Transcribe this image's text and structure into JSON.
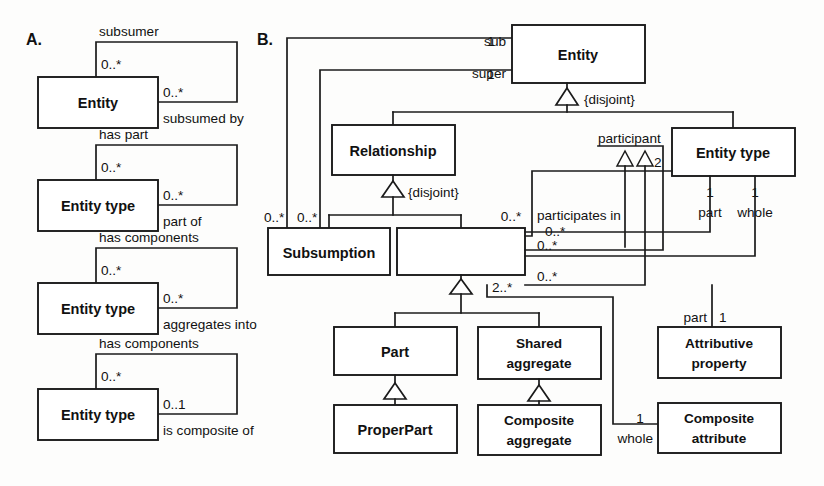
{
  "figure": {
    "panels": [
      {
        "id": "A",
        "letter": "A."
      },
      {
        "id": "B",
        "letter": "B."
      }
    ]
  },
  "panel_a": {
    "letter": "A.",
    "groups": [
      {
        "name": "subsumption-relation",
        "class_label": "Entity",
        "top_role": "subsumer",
        "top_multiplicity": "0..*",
        "bottom_role": "subsumed by",
        "bottom_multiplicity": "0..*"
      },
      {
        "name": "has-part-relation",
        "class_label": "Entity type",
        "top_role": "has part",
        "top_multiplicity": "0..*",
        "bottom_role": "part of",
        "bottom_multiplicity": "0..*"
      },
      {
        "name": "aggregation-relation",
        "class_label": "Entity type",
        "top_role": "has components",
        "top_multiplicity": "0..*",
        "bottom_role": "aggregates into",
        "bottom_multiplicity": "0..*"
      },
      {
        "name": "composition-relation",
        "class_label": "Entity type",
        "top_role": "has components",
        "top_multiplicity": "0..*",
        "bottom_role": "is composite of",
        "bottom_multiplicity": "0..1"
      }
    ]
  },
  "panel_b": {
    "letter": "B.",
    "classes": {
      "entity": "Entity",
      "relationship": "Relationship",
      "entity_type_line1": "Entity",
      "entity_type_line2": "type",
      "entity_type": "Entity type",
      "subsumption": "Subsumption",
      "part_whole": "PartWhole",
      "part": "Part",
      "shared_aggregate_line1": "Shared",
      "shared_aggregate_line2": "aggregate",
      "proper_part": "ProperPart",
      "composite_aggregate_line1": "Composite",
      "composite_aggregate_line2": "aggregate",
      "attributive_property_line1": "Attributive",
      "attributive_property_line2": "property",
      "composite_attribute_line1": "Composite",
      "composite_attribute_line2": "attribute"
    },
    "roles": {
      "sub": "sub",
      "super": "super",
      "participant": "participant",
      "participates_in": "participates in",
      "part": "part",
      "whole": "whole",
      "part2": "part",
      "whole2": "whole"
    },
    "multiplicities": {
      "sub": "1",
      "super": "1",
      "subsumption_left_outer": "0..*",
      "subsumption_left_inner": "0..*",
      "participant": "2",
      "participates_in_0n": "0..*",
      "partwhole_right_a": "0..*",
      "partwhole_right_b": "0..*",
      "partwhole_right_c": "0..*",
      "partwhole_bottom": "2..*",
      "entity_type_part": "1",
      "entity_type_whole": "1",
      "attributive_part": "1",
      "composite_whole": "1"
    },
    "constraints": {
      "entity_disjoint": "{disjoint}",
      "relationship_disjoint": "{disjoint}"
    }
  }
}
